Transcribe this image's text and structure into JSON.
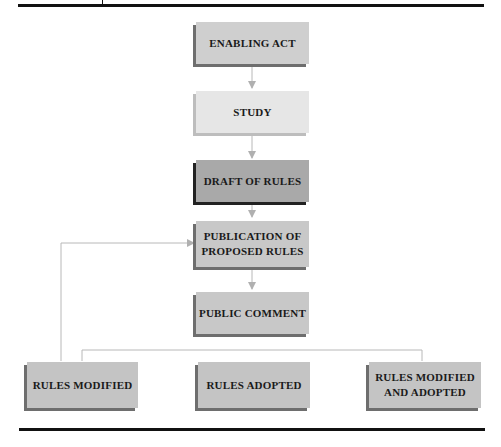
{
  "diagram": {
    "nodes": [
      {
        "id": "enabling_act",
        "label": "ENABLING ACT",
        "color": "#cfcfcf"
      },
      {
        "id": "study",
        "label": "STUDY",
        "color": "#e6e6e6"
      },
      {
        "id": "draft_of_rules",
        "label": "DRAFT OF RULES",
        "color": "#a9a9a9"
      },
      {
        "id": "publication",
        "label": "PUBLICATION OF\nPROPOSED RULES",
        "line1": "PUBLICATION OF",
        "line2": "PROPOSED RULES",
        "color": "#c8c8c8"
      },
      {
        "id": "public_comment",
        "label": "PUBLIC COMMENT",
        "color": "#c8c8c8"
      },
      {
        "id": "rules_modified",
        "label": "RULES MODIFIED",
        "color": "#c4c4c4"
      },
      {
        "id": "rules_adopted",
        "label": "RULES ADOPTED",
        "color": "#c4c4c4"
      },
      {
        "id": "rules_modified_adopted",
        "label": "RULES MODIFIED\nAND ADOPTED",
        "line1": "RULES MODIFIED",
        "line2": "AND ADOPTED",
        "color": "#c4c4c4"
      }
    ],
    "edges": [
      {
        "from": "enabling_act",
        "to": "study"
      },
      {
        "from": "study",
        "to": "draft_of_rules"
      },
      {
        "from": "draft_of_rules",
        "to": "publication"
      },
      {
        "from": "publication",
        "to": "public_comment"
      },
      {
        "from": "public_comment",
        "to": "rules_modified"
      },
      {
        "from": "public_comment",
        "to": "rules_adopted"
      },
      {
        "from": "public_comment",
        "to": "rules_modified_adopted"
      },
      {
        "from": "rules_modified",
        "to": "publication",
        "type": "feedback"
      }
    ],
    "connector_color": "#b5b5b5"
  }
}
